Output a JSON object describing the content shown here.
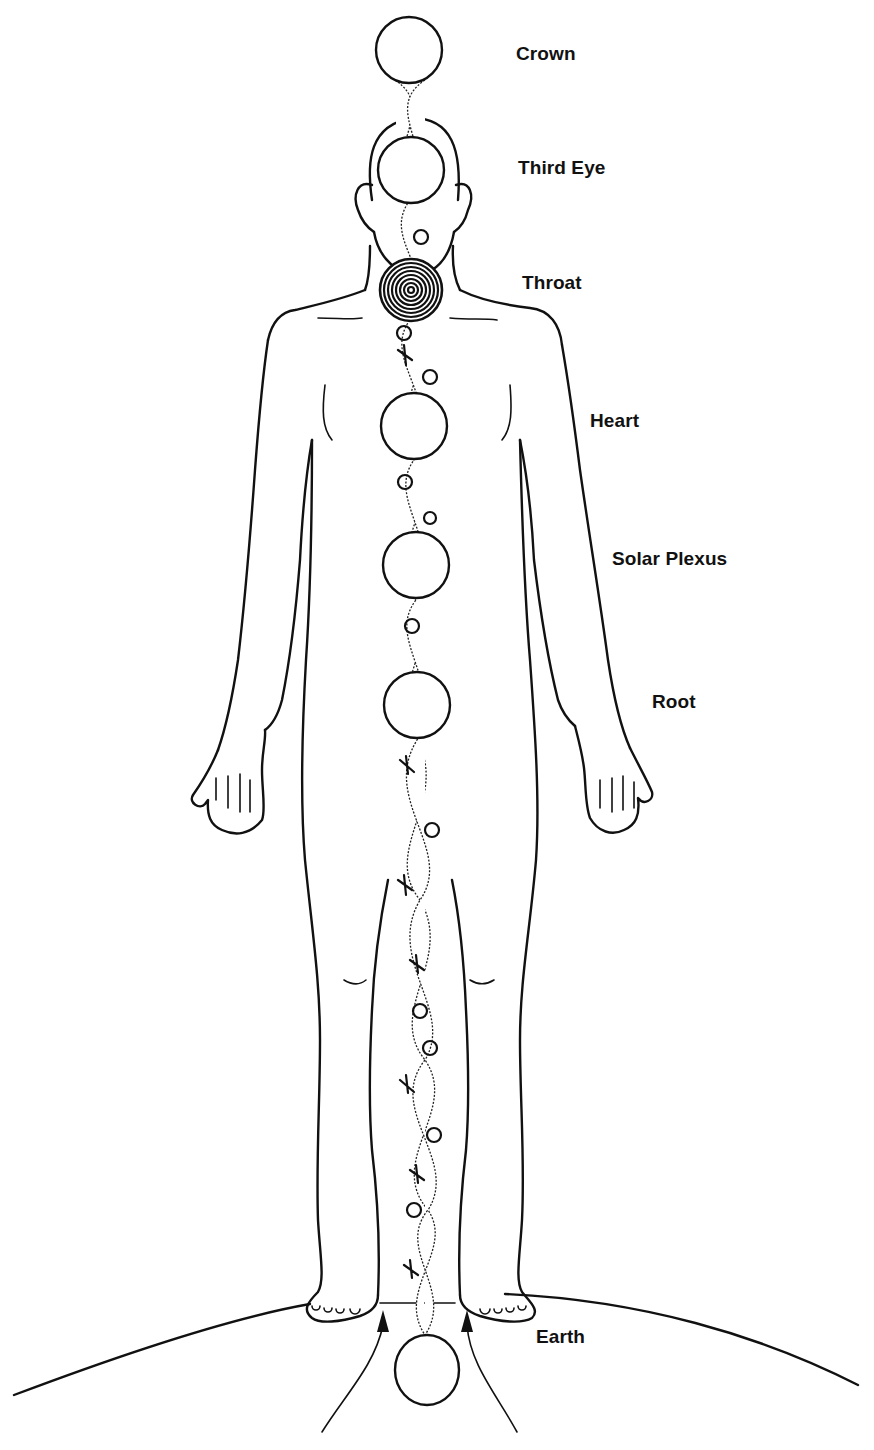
{
  "diagram": {
    "colors": {
      "line": "#111111",
      "background": "#ffffff"
    },
    "chakras": [
      {
        "id": "crown",
        "label": "Crown",
        "cx": 409,
        "cy": 50,
        "r": 33,
        "style": "plain",
        "label_x": 516,
        "label_y": 43
      },
      {
        "id": "third-eye",
        "label": "Third Eye",
        "cx": 411,
        "cy": 170,
        "r": 33,
        "style": "plain",
        "label_x": 518,
        "label_y": 157
      },
      {
        "id": "throat",
        "label": "Throat",
        "cx": 411,
        "cy": 290,
        "r": 31,
        "style": "concentric",
        "label_x": 522,
        "label_y": 272
      },
      {
        "id": "heart",
        "label": "Heart",
        "cx": 414,
        "cy": 426,
        "r": 33,
        "style": "plain",
        "label_x": 590,
        "label_y": 410
      },
      {
        "id": "solar-plexus",
        "label": "Solar Plexus",
        "cx": 416,
        "cy": 565,
        "r": 33,
        "style": "plain",
        "label_x": 612,
        "label_y": 548
      },
      {
        "id": "root",
        "label": "Root",
        "cx": 417,
        "cy": 705,
        "r": 33,
        "style": "plain",
        "label_x": 652,
        "label_y": 691
      },
      {
        "id": "earth",
        "label": "Earth",
        "cx": 427,
        "cy": 1370,
        "r": 33,
        "style": "plain",
        "label_x": 536,
        "label_y": 1326
      }
    ],
    "arrows": [
      {
        "id": "left-upward-arrow",
        "direction": "up"
      },
      {
        "id": "right-upward-arrow",
        "direction": "up"
      }
    ]
  }
}
